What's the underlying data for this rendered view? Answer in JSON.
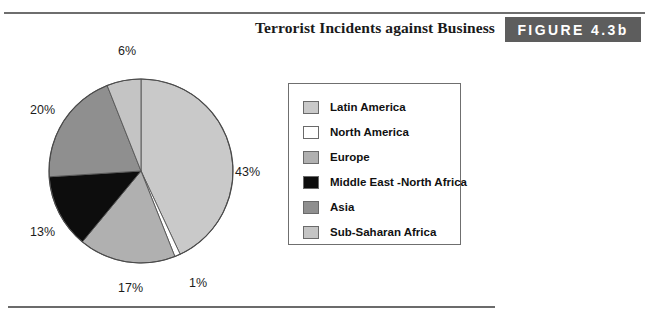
{
  "header": {
    "title": "Terrorist Incidents against Business",
    "figure_badge": "FIGURE 4.3b"
  },
  "legend": {
    "items": [
      {
        "label": "Latin America",
        "color": "#c9c9c9"
      },
      {
        "label": "North America",
        "color": "#ffffff"
      },
      {
        "label": "Europe",
        "color": "#b0b0b0"
      },
      {
        "label": "Middle East -North Africa",
        "color": "#0d0d0d"
      },
      {
        "label": "Asia",
        "color": "#8f8f8f"
      },
      {
        "label": "Sub-Saharan Africa",
        "color": "#c4c4c4"
      }
    ]
  },
  "labels": {
    "top": "6%",
    "left_upper": "20%",
    "left_lower": "13%",
    "bottom_left": "17%",
    "bottom_right": "1%",
    "right": "43%"
  },
  "chart_data": {
    "type": "pie",
    "title": "Terrorist Incidents against Business",
    "categories": [
      "Latin America",
      "North America",
      "Europe",
      "Middle East -North Africa",
      "Asia",
      "Sub-Saharan Africa"
    ],
    "values": [
      43,
      1,
      17,
      13,
      20,
      6
    ],
    "value_labels": [
      "43%",
      "1%",
      "17%",
      "13%",
      "20%",
      "6%"
    ],
    "unit": "percent",
    "colors": [
      "#c9c9c9",
      "#ffffff",
      "#b0b0b0",
      "#0d0d0d",
      "#8f8f8f",
      "#c4c4c4"
    ],
    "start_angle_deg": 0,
    "direction": "clockwise",
    "legend_position": "right",
    "grid": false
  }
}
